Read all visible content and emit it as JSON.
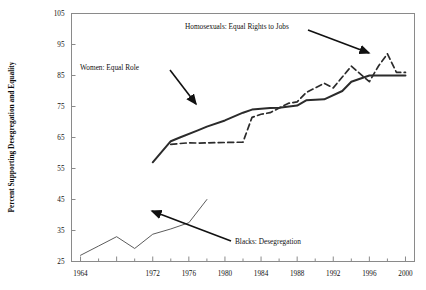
{
  "chart_data": {
    "type": "line",
    "title": "",
    "xlabel": "",
    "ylabel": "Percent Supporting Desegregation and Equality",
    "xlim": [
      1963,
      2001
    ],
    "ylim": [
      25,
      105
    ],
    "ytick_step": 10,
    "yticks": [
      25,
      35,
      45,
      55,
      65,
      75,
      85,
      95,
      105
    ],
    "ytick_labels": [
      "25",
      "35",
      "45",
      "55",
      "65",
      "75",
      "85",
      "95",
      "105"
    ],
    "xticks": [
      1964,
      1968,
      1972,
      1976,
      1980,
      1984,
      1988,
      1992,
      1996,
      2000
    ],
    "xtick_labels": [
      "1964",
      "1968",
      "1972",
      "1976",
      "1980",
      "1984",
      "1988",
      "1992",
      "1996",
      "2000"
    ],
    "xtick_labels_shown": [
      "1964",
      "1972",
      "1976",
      "1980",
      "1984",
      "1988",
      "1992",
      "1996",
      "2000"
    ],
    "xminor_step": 2,
    "grid": false,
    "legend_position": "inline-annotations",
    "series": [
      {
        "name": "Women: Equal Role",
        "style": "solid",
        "color": "#2b2b2b",
        "x": [
          1972,
          1974,
          1975,
          1977,
          1978,
          1980,
          1982,
          1983,
          1984,
          1985,
          1986,
          1988,
          1989,
          1990,
          1991,
          1993,
          1994,
          1996,
          1998,
          2000
        ],
        "y": [
          57.0,
          63.8,
          65.0,
          67.3,
          68.5,
          70.5,
          73.0,
          74.0,
          74.3,
          74.5,
          74.6,
          75.3,
          77.0,
          77.2,
          77.3,
          80.0,
          83.0,
          85.0,
          85.0,
          85.0
        ]
      },
      {
        "name": "Homosexuals: Equal Rights to Jobs",
        "style": "dashed",
        "color": "#2b2b2b",
        "x": [
          1974,
          1976,
          1977,
          1980,
          1982,
          1983,
          1984,
          1985,
          1986,
          1987,
          1988,
          1989,
          1990,
          1991,
          1992,
          1993,
          1994,
          1996,
          1997,
          1998,
          1999,
          2000
        ],
        "y": [
          62.8,
          63.3,
          63.2,
          63.4,
          63.5,
          71.5,
          72.5,
          73.0,
          74.5,
          76.0,
          76.5,
          79.5,
          81.0,
          82.5,
          81.0,
          84.5,
          88.0,
          83.0,
          88.0,
          92.0,
          86.0,
          86.0
        ]
      },
      {
        "name": "Blacks: Desegregation",
        "style": "solid-thin",
        "color": "#4a4a4a",
        "x": [
          1964,
          1966,
          1968,
          1970,
          1972,
          1974,
          1976,
          1978
        ],
        "y": [
          27.0,
          30.0,
          33.0,
          29.2,
          33.8,
          35.5,
          37.5,
          45.0
        ]
      }
    ],
    "annotations": [
      {
        "id": "annot-women",
        "text": "Women: Equal Role"
      },
      {
        "id": "annot-homosexuals",
        "text": "Homosexuals: Equal Rights to Jobs"
      },
      {
        "id": "annot-blacks",
        "text": "Blacks: Desegregation"
      }
    ]
  }
}
